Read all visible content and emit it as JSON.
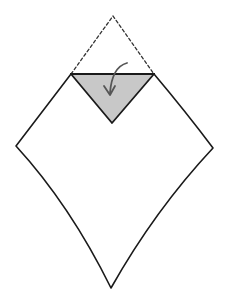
{
  "diagram": {
    "title": "Origami step: fold top corner down",
    "colors": {
      "background": "#ffffff",
      "paper_fill": "#ffffff",
      "outline": "#1a1a1a",
      "flap_fill": "#c8c8c8",
      "dashed_line": "#333333",
      "arrow": "#555555"
    },
    "shapes": {
      "paper_outline": {
        "top_left": [
          71,
          74
        ],
        "top_right": [
          154,
          74
        ],
        "right_corner": [
          213,
          148
        ],
        "bottom": [
          111,
          288
        ],
        "left_corner": [
          16,
          146
        ]
      },
      "original_corner_dashed": {
        "apex": [
          113,
          16
        ],
        "left": [
          71,
          74
        ],
        "right": [
          154,
          74
        ]
      },
      "folded_flap": {
        "left": [
          71,
          74
        ],
        "right": [
          154,
          74
        ],
        "tip": [
          112,
          123
        ]
      },
      "fold_arrow": {
        "start": [
          126,
          63
        ],
        "end": [
          109,
          95
        ],
        "direction": "down"
      }
    }
  }
}
